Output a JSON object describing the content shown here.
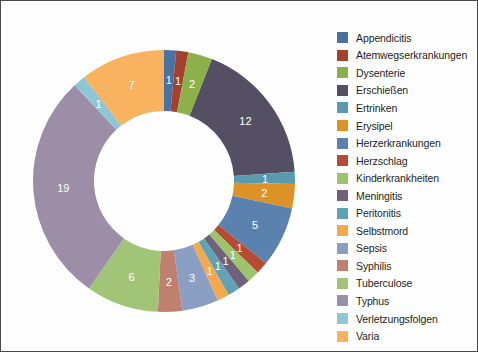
{
  "chart_data": {
    "type": "pie",
    "variant": "donut",
    "title": "",
    "subtitle": "",
    "xlabel": "",
    "ylabel": "",
    "legend_position": "right",
    "grid": false,
    "total": 67,
    "start_angle_deg": 0,
    "direction": "clockwise",
    "categories": [
      "Appendicitis",
      "Atemwegserkrankungen",
      "Dysenterie",
      "Erschießen",
      "Ertrinken",
      "Erysipel",
      "Herzerkrankungen",
      "Herzschlag",
      "Kinderkrankheiten",
      "Meningitis",
      "Peritonitis",
      "Selbstmord",
      "Sepsis",
      "Syphilis",
      "Tuberculose",
      "Typhus",
      "Verletzungsfolgen",
      "Varia"
    ],
    "values": [
      1,
      1,
      2,
      12,
      1,
      2,
      5,
      1,
      1,
      1,
      1,
      1,
      3,
      2,
      6,
      19,
      1,
      7
    ],
    "colors": [
      "#4a72a0",
      "#a3412e",
      "#8cb14a",
      "#554f63",
      "#5a9aae",
      "#dd9227",
      "#5b82ae",
      "#b44b33",
      "#9dc46a",
      "#6e6179",
      "#5fa3b4",
      "#f5a94e",
      "#8b9ec4",
      "#c08070",
      "#a2c477",
      "#9b8ea6",
      "#8fc6d6",
      "#f9b25f"
    ],
    "data_labels": [
      "1",
      "1",
      "2",
      "12",
      "1",
      "2",
      "5",
      "1",
      "1",
      "1",
      "1",
      "1",
      "3",
      "2",
      "6",
      "19",
      "1",
      "7"
    ]
  },
  "legend": {
    "items": [
      {
        "label": "Appendicitis",
        "color": "#4a72a0"
      },
      {
        "label": "Atemwegserkrankungen",
        "color": "#a3412e"
      },
      {
        "label": "Dysenterie",
        "color": "#8cb14a"
      },
      {
        "label": "Erschießen",
        "color": "#554f63"
      },
      {
        "label": "Ertrinken",
        "color": "#5a9aae"
      },
      {
        "label": "Erysipel",
        "color": "#dd9227"
      },
      {
        "label": "Herzerkrankungen",
        "color": "#5b82ae"
      },
      {
        "label": "Herzschlag",
        "color": "#b44b33"
      },
      {
        "label": "Kinderkrankheiten",
        "color": "#9dc46a"
      },
      {
        "label": "Meningitis",
        "color": "#6e6179"
      },
      {
        "label": "Peritonitis",
        "color": "#5fa3b4"
      },
      {
        "label": "Selbstmord",
        "color": "#f5a94e"
      },
      {
        "label": "Sepsis",
        "color": "#8b9ec4"
      },
      {
        "label": "Syphilis",
        "color": "#c08070"
      },
      {
        "label": "Tuberculose",
        "color": "#a2c477"
      },
      {
        "label": "Typhus",
        "color": "#9b8ea6"
      },
      {
        "label": "Verletzungsfolgen",
        "color": "#8fc6d6"
      },
      {
        "label": "Varia",
        "color": "#f9b25f"
      }
    ]
  },
  "geometry": {
    "cx": 151,
    "cy": 166,
    "outer_radius": 131,
    "inner_radius": 70,
    "label_radius": 101
  }
}
